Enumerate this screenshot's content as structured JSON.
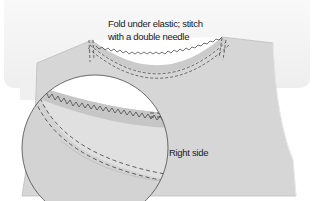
{
  "diagram": {
    "type": "sewing-illustration",
    "annotations": {
      "caption_line1": "Fold under elastic; stitch",
      "caption_line2": "with a double needle",
      "fabric_side_label": "Right side"
    },
    "elements": [
      {
        "name": "background-panel",
        "description": "light gray rounded panel behind garment"
      },
      {
        "name": "garment-front",
        "description": "gray fabric bodice with scoop neckline"
      },
      {
        "name": "neckline-elastic-band",
        "description": "elastic band with zigzag stitch along neckline"
      },
      {
        "name": "double-needle-stitching",
        "description": "two parallel dashed stitch lines"
      },
      {
        "name": "magnifier-circle",
        "description": "enlarged detail of elastic fold and stitching"
      }
    ],
    "colors": {
      "panel": "#f3f3f3",
      "fabric": "#d4d4d4",
      "fabric_light": "#e2e2e2",
      "band": "#c9c9c9",
      "stitch": "#3a3a3a",
      "outline": "#4a4a4a",
      "neck_opening": "#ffffff"
    }
  }
}
